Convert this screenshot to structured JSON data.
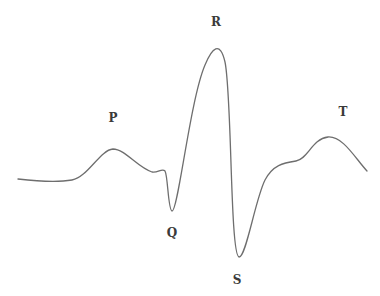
{
  "diagram": {
    "stroke_color": "#6e6e6e",
    "label_color": "#3a3a3a",
    "labels": [
      {
        "id": "P",
        "text": "P",
        "x": 113,
        "y": 118
      },
      {
        "id": "Q",
        "text": "Q",
        "x": 172,
        "y": 233
      },
      {
        "id": "R",
        "text": "R",
        "x": 216,
        "y": 22
      },
      {
        "id": "S",
        "text": "S",
        "x": 237,
        "y": 280
      },
      {
        "id": "T",
        "text": "T",
        "x": 343,
        "y": 112
      }
    ],
    "curve_points": [
      {
        "name": "start",
        "x": 18,
        "y": 179
      },
      {
        "name": "baseline",
        "x": 55,
        "y": 181
      },
      {
        "name": "P-peak",
        "x": 113,
        "y": 149
      },
      {
        "name": "PR-segment",
        "x": 152,
        "y": 172
      },
      {
        "name": "pre-Q-bump",
        "x": 164,
        "y": 170
      },
      {
        "name": "Q-trough",
        "x": 172,
        "y": 210
      },
      {
        "name": "R-peak",
        "x": 216,
        "y": 48
      },
      {
        "name": "S-trough",
        "x": 239,
        "y": 257
      },
      {
        "name": "ST-shoulder",
        "x": 285,
        "y": 162
      },
      {
        "name": "T-peak",
        "x": 330,
        "y": 137
      },
      {
        "name": "end",
        "x": 367,
        "y": 171
      }
    ]
  }
}
